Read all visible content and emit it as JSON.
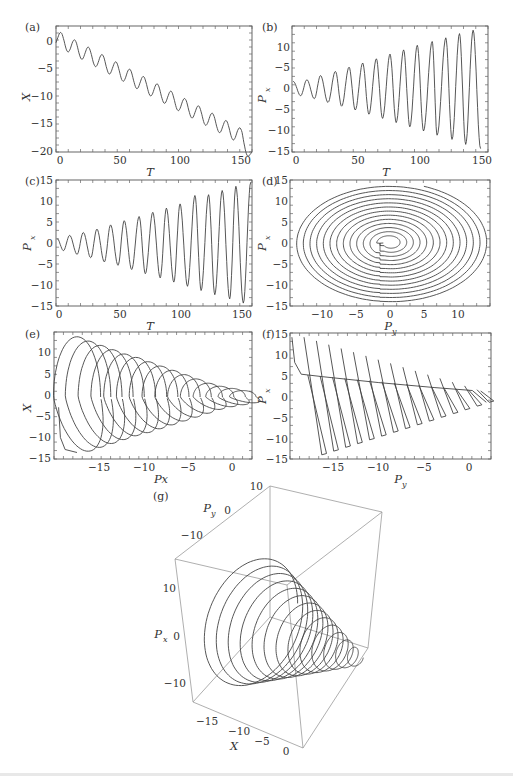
{
  "figure": {
    "panels": [
      "(a)",
      "(b)",
      "(c)",
      "(d)",
      "(e)",
      "(f)",
      "(g)"
    ]
  },
  "chart_data": [
    {
      "panel": "(a)",
      "type": "line",
      "xlabel": "T",
      "ylabel": "X",
      "xlim": [
        0,
        158
      ],
      "ylim": [
        -20,
        2.5
      ],
      "xticks": [
        "0",
        "50",
        "100",
        "150"
      ],
      "yticks": [
        "0",
        "−5",
        "−10",
        "−15",
        "−20"
      ],
      "description": "Damped oscillation with linear downward drift; ~14 oscillation periods of period ≈11",
      "x": [
        0,
        4,
        10,
        15,
        21,
        26,
        32,
        37,
        43,
        48,
        54,
        59,
        65,
        70,
        76,
        81,
        87,
        92,
        98,
        103,
        109,
        114,
        120,
        125,
        131,
        136,
        142,
        147,
        153,
        158
      ],
      "y": [
        0,
        1.8,
        -1.9,
        0.5,
        -3.2,
        -1,
        -4.6,
        -2.4,
        -6,
        -3.8,
        -7.4,
        -5.1,
        -8.8,
        -6.5,
        -10.2,
        -7.9,
        -11.6,
        -9.3,
        -13,
        -10.7,
        -14.4,
        -12,
        -15.7,
        -13.3,
        -17,
        -14.6,
        -18.3,
        -15.6,
        -16.5,
        -19.5
      ]
    },
    {
      "panel": "(b)",
      "type": "line",
      "xlabel": "T",
      "ylabel": "P_x",
      "xlim": [
        0,
        158
      ],
      "ylim": [
        -15,
        15
      ],
      "xticks": [
        "0",
        "50",
        "100",
        "150"
      ],
      "yticks": [
        "10",
        "−5",
        "0",
        "−5",
        "−10",
        "−15"
      ],
      "description": "Oscillation with linearly growing amplitude; peaks rise from ~2 to ~14, troughs fall from ~-2 to ~-14",
      "peaks": [
        {
          "T": 1,
          "P": 1.8
        },
        {
          "T": 12,
          "P": 2.2
        },
        {
          "T": 23,
          "P": 3.2
        },
        {
          "T": 35,
          "P": 4.2
        },
        {
          "T": 46,
          "P": 5.2
        },
        {
          "T": 57,
          "P": 6.2
        },
        {
          "T": 68,
          "P": 7.2
        },
        {
          "T": 79,
          "P": 8.3
        },
        {
          "T": 90,
          "P": 9.3
        },
        {
          "T": 101,
          "P": 10.4
        },
        {
          "T": 113,
          "P": 11.3
        },
        {
          "T": 124,
          "P": 12.2
        },
        {
          "T": 135,
          "P": 13.2
        },
        {
          "T": 146,
          "P": 14
        }
      ],
      "troughs": [
        {
          "T": 7,
          "P": -1.6
        },
        {
          "T": 18,
          "P": -2.3
        },
        {
          "T": 29,
          "P": -3.2
        },
        {
          "T": 40,
          "P": -4.1
        },
        {
          "T": 51,
          "P": -5
        },
        {
          "T": 62,
          "P": -6
        },
        {
          "T": 73,
          "P": -7
        },
        {
          "T": 84,
          "P": -8
        },
        {
          "T": 95,
          "P": -9
        },
        {
          "T": 106,
          "P": -10
        },
        {
          "T": 117,
          "P": -11
        },
        {
          "T": 129,
          "P": -12
        },
        {
          "T": 140,
          "P": -13.2
        },
        {
          "T": 152,
          "P": -14.2
        }
      ]
    },
    {
      "panel": "(c)",
      "type": "line",
      "xlabel": "T",
      "ylabel": "P_x",
      "xlim": [
        0,
        158
      ],
      "ylim": [
        -15,
        15
      ],
      "xticks": [
        "0",
        "50",
        "100",
        "150"
      ],
      "yticks": [
        "15",
        "10",
        "5",
        "0",
        "−5",
        "−10",
        "−15"
      ],
      "description": "Oscillation with growing amplitude and sawtooth-like shape; peaks rise to ~14, troughs to ~-14",
      "peaks": [
        {
          "T": 1,
          "P": 1
        },
        {
          "T": 11,
          "P": 1.8
        },
        {
          "T": 22,
          "P": 2.5
        },
        {
          "T": 33,
          "P": 3.3
        },
        {
          "T": 44,
          "P": 4.3
        },
        {
          "T": 55,
          "P": 5.3
        },
        {
          "T": 67,
          "P": 6.3
        },
        {
          "T": 78,
          "P": 7.3
        },
        {
          "T": 89,
          "P": 8.3
        },
        {
          "T": 100,
          "P": 9.3
        },
        {
          "T": 112,
          "P": 11.3
        },
        {
          "T": 123,
          "P": 11.5
        },
        {
          "T": 134,
          "P": 12.5
        },
        {
          "T": 145,
          "P": 13.5
        },
        {
          "T": 157,
          "P": 14.5
        }
      ],
      "troughs": [
        {
          "T": 6,
          "P": -1.8
        },
        {
          "T": 17,
          "P": -2.7
        },
        {
          "T": 28,
          "P": -3.5
        },
        {
          "T": 39,
          "P": -4.5
        },
        {
          "T": 50,
          "P": -5.3
        },
        {
          "T": 61,
          "P": -6.3
        },
        {
          "T": 72,
          "P": -7.3
        },
        {
          "T": 84,
          "P": -8.3
        },
        {
          "T": 95,
          "P": -9.3
        },
        {
          "T": 106,
          "P": -10.3
        },
        {
          "T": 117,
          "P": -11.3
        },
        {
          "T": 128,
          "P": -12.3
        },
        {
          "T": 140,
          "P": -13.3
        },
        {
          "T": 151,
          "P": -14.3
        }
      ]
    },
    {
      "panel": "(d)",
      "type": "line",
      "xlabel": "P_y",
      "ylabel": "P_x",
      "xlim": [
        -15,
        15
      ],
      "ylim": [
        -15,
        15
      ],
      "xticks": [
        "−10",
        "−5",
        "0",
        "5",
        "10"
      ],
      "yticks": [
        "15",
        "10",
        "5",
        "0",
        "−5",
        "−10",
        "−15"
      ],
      "description": "Phase portrait: outward spiral of ~13 near-elliptical loops centered at origin, radius growing ~1 per loop to ~14; a seam at Py≈-1.5 for negative Px",
      "loop_radii": [
        1,
        2,
        3,
        4,
        5,
        6,
        7,
        8,
        9,
        10,
        11,
        12,
        13,
        14
      ]
    },
    {
      "panel": "(e)",
      "type": "line",
      "xlabel": "Px",
      "ylabel": "X",
      "xlim": [
        -19.5,
        2
      ],
      "ylim": [
        -15,
        14.5
      ],
      "xticks": [
        "−15",
        "−10",
        "−5",
        "0"
      ],
      "yticks": [
        "10",
        "5",
        "0",
        "−5",
        "−10",
        "−15"
      ],
      "description": "Sequence of ~14 overlapping loops shrinking toward right; loop centers drift from Px≈-17 to Px≈1 with amplitude shrinking from ~14 to ~2",
      "loop_centers_Px": [
        -17,
        -15.8,
        -14.5,
        -13.2,
        -11.9,
        -10.6,
        -9.3,
        -8,
        -6.7,
        -5.4,
        -4.1,
        -2.8,
        -1.5,
        -0.2,
        1
      ],
      "loop_amplitudes": [
        14,
        13,
        12,
        11,
        10,
        9.2,
        8.2,
        7.2,
        6.2,
        5.2,
        4.2,
        3.2,
        2.5,
        2,
        1.5
      ]
    },
    {
      "panel": "(f)",
      "type": "line",
      "xlabel": "P_y",
      "ylabel": "P_x",
      "xlim": [
        -19.5,
        2
      ],
      "ylim": [
        -15,
        15
      ],
      "xticks": [
        "−15",
        "−10",
        "−5",
        "0"
      ],
      "yticks": [
        "15",
        "10",
        "5",
        "0",
        "−5",
        "−10",
        "−15"
      ],
      "description": "Series of ~15 thin slanted loops (steep diagonal strokes) with tops on a gently decreasing baseline from ~5 at Py=-18 to ~1 at Py=0, bottoms from ~-14 to ~-1"
    },
    {
      "panel": "(g)",
      "type": "line",
      "projection": "3d",
      "xlabel": "X",
      "ylabel": "P_y",
      "zlabel": "P_x",
      "xticks": [
        "−15",
        "−10",
        "−5",
        "0"
      ],
      "yticks": [
        "−10",
        "0",
        "10"
      ],
      "zticks": [
        "10",
        "0",
        "−10"
      ],
      "description": "3D trajectory forming a conical spiral (cone) with ~13 rings, widest near X=-17 narrowing toward X=0"
    }
  ],
  "labels": {
    "a": {
      "tag": "(a)",
      "xlabel": "T",
      "ylabel": "X",
      "xticks": [
        "0",
        "50",
        "100",
        "150"
      ],
      "yticks": [
        "0",
        "−5",
        "−10",
        "−15",
        "−20"
      ]
    },
    "b": {
      "tag": "(b)",
      "xlabel": "T",
      "ylabel": "P",
      "ysub": "x",
      "xticks": [
        "0",
        "50",
        "100",
        "150"
      ],
      "yticks": [
        "10",
        "−5",
        "0",
        "−5",
        "−10",
        "−15"
      ]
    },
    "c": {
      "tag": "(c)",
      "xlabel": "T",
      "ylabel": "P",
      "ysub": "x",
      "xticks": [
        "0",
        "50",
        "100",
        "150"
      ],
      "yticks": [
        "15",
        "10",
        "5",
        "0",
        "−5",
        "−10",
        "−15"
      ]
    },
    "d": {
      "tag": "(d)",
      "xlabel": "P",
      "xsub": "y",
      "ylabel": "P",
      "ysub": "x",
      "xticks": [
        "−10",
        "−5",
        "0",
        "5",
        "10"
      ],
      "yticks": [
        "15",
        "10",
        "5",
        "0",
        "−5",
        "−10",
        "−15"
      ]
    },
    "e": {
      "tag": "(e)",
      "xlabel": "Px",
      "ylabel": "X",
      "xticks": [
        "−15",
        "−10",
        "−5",
        "0"
      ],
      "yticks": [
        "10",
        "5",
        "0",
        "−5",
        "−10",
        "−15"
      ]
    },
    "f": {
      "tag": "(f)",
      "xlabel": "P",
      "xsub": "y",
      "ylabel": "P",
      "ysub": "x",
      "xticks": [
        "−15",
        "−10",
        "−5",
        "0"
      ],
      "yticks": [
        "15",
        "10",
        "5",
        "0",
        "−5",
        "−10",
        "−15"
      ]
    },
    "g": {
      "tag": "(g)",
      "xlabel": "X",
      "ylabel": "P",
      "ysub": "y",
      "zlabel": "P",
      "zsub": "x",
      "xticks": [
        "−15",
        "−10",
        "−5",
        "0"
      ],
      "yticks": [
        "10",
        "0",
        "−10"
      ],
      "zticks": [
        "10",
        "0",
        "−10"
      ]
    }
  }
}
